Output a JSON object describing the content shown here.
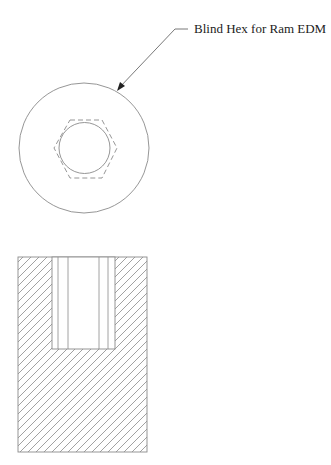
{
  "drawing": {
    "callout_label": "Blind Hex for Ram EDM",
    "line_color": "#8a8a8a",
    "leader_color": "#555555",
    "text_color": "#222222",
    "views": [
      {
        "name": "top view",
        "outer_circle": {
          "cx": 84,
          "cy": 148,
          "r": 65
        },
        "inner_circle": {
          "cx": 84.5,
          "cy": 148,
          "r": 25.5
        },
        "hidden_hexagon": {
          "cx": 85,
          "cy": 149,
          "r": 32,
          "style": "dashed"
        }
      },
      {
        "name": "section view",
        "outer_rect": {
          "x": 18,
          "y": 257,
          "w": 129,
          "h": 195
        },
        "pocket_rect": {
          "x": 52,
          "y": 257,
          "w": 63,
          "h": 92
        },
        "pocket_lines_x": [
          58,
          68,
          99,
          108
        ],
        "hatch": {
          "angle_deg": 45,
          "spacing": 8
        }
      }
    ]
  }
}
